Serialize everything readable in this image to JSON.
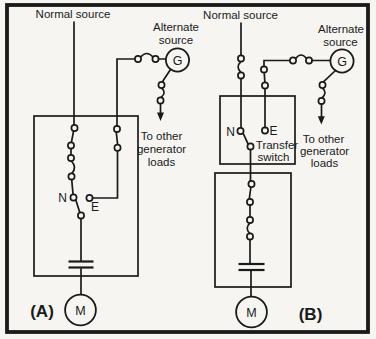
{
  "figure": {
    "colors": {
      "ink": "#1a1a1a",
      "paper": "#f6f5f2"
    },
    "panel_a": {
      "panel_label": "(A)",
      "normal_source_label": "Normal source",
      "alternate_source_line1": "Alternate",
      "alternate_source_line2": "source",
      "generator_letter": "G",
      "motor_letter": "M",
      "normal_contact_label": "N",
      "emergency_contact_label": "E",
      "generator_loads_line1": "To other",
      "generator_loads_line2": "generator",
      "generator_loads_line3": "loads"
    },
    "panel_b": {
      "panel_label": "(B)",
      "normal_source_label": "Normal source",
      "alternate_source_line1": "Alternate",
      "alternate_source_line2": "source",
      "generator_letter": "G",
      "motor_letter": "M",
      "normal_contact_label": "N",
      "emergency_contact_label": "E",
      "transfer_switch_line1": "Transfer",
      "transfer_switch_line2": "switch",
      "generator_loads_line1": "To other",
      "generator_loads_line2": "generator",
      "generator_loads_line3": "loads"
    }
  }
}
